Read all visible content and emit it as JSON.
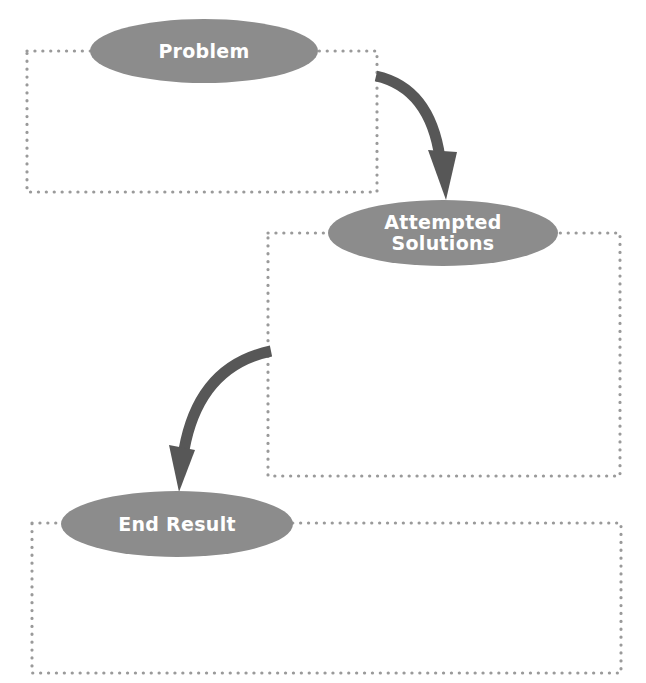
{
  "diagram": {
    "type": "flow-organizer",
    "colors": {
      "ellipse_fill": "#8c8c8c",
      "arrow_fill": "#575757",
      "dotted_border": "#9a9a9a",
      "label_text": "#ffffff",
      "background": "#ffffff"
    },
    "sections": [
      {
        "id": "problem",
        "label": "Problem",
        "content": ""
      },
      {
        "id": "attempted-solutions",
        "label_line1": "Attempted",
        "label_line2": "Solutions",
        "content": ""
      },
      {
        "id": "end-result",
        "label": "End Result",
        "content": ""
      }
    ],
    "connectors": [
      {
        "from": "problem",
        "to": "attempted-solutions",
        "style": "curved-arrow"
      },
      {
        "from": "attempted-solutions",
        "to": "end-result",
        "style": "curved-arrow"
      }
    ]
  }
}
